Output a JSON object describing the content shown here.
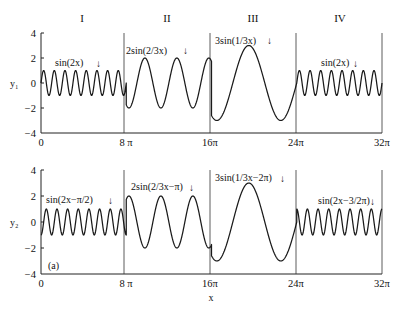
{
  "chart_data": [
    {
      "type": "line",
      "id": "top",
      "ylabel": "y₁",
      "xlabel": "",
      "xlim": [
        0,
        32
      ],
      "x_unit": "π",
      "ylim": [
        -4,
        4
      ],
      "yticks": [
        4,
        2,
        0,
        -2,
        -4
      ],
      "ytick_labels": [
        "4",
        "2",
        "0",
        "−2",
        "−4"
      ],
      "xticks": [
        0,
        8,
        16,
        24,
        32
      ],
      "xtick_labels": [
        "0",
        "8 π",
        "16π",
        "24π",
        "32π"
      ],
      "region_labels": [
        "I",
        "II",
        "III",
        "IV"
      ],
      "dividers": [
        8,
        16,
        24
      ],
      "segments": [
        {
          "region": "I",
          "x_range": [
            0,
            8
          ],
          "amplitude": 1,
          "freq": 2,
          "phase": 0,
          "label": "sin(2x)",
          "arrow": "↓"
        },
        {
          "region": "II",
          "x_range": [
            8,
            16
          ],
          "amplitude": 2,
          "freq": 0.6667,
          "phase": 0,
          "label": "2sin(2/3x)",
          "arrow": "↓"
        },
        {
          "region": "III",
          "x_range": [
            16,
            24
          ],
          "amplitude": 3,
          "freq": 0.3333,
          "phase": 0,
          "label": "3sin(1/3x)",
          "arrow": "↓"
        },
        {
          "region": "IV",
          "x_range": [
            24,
            32
          ],
          "amplitude": 1,
          "freq": 2,
          "phase": 0,
          "label": "sin(2x)",
          "arrow": "↓"
        }
      ]
    },
    {
      "type": "line",
      "id": "bottom",
      "ylabel": "y₂",
      "xlabel": "x",
      "panel_label": "(a)",
      "xlim": [
        0,
        32
      ],
      "x_unit": "π",
      "ylim": [
        -4,
        4
      ],
      "yticks": [
        4,
        2,
        0,
        -2,
        -4
      ],
      "ytick_labels": [
        "4",
        "2",
        "0",
        "−2",
        "−4"
      ],
      "xticks": [
        0,
        8,
        16,
        24,
        32
      ],
      "xtick_labels": [
        "0",
        "8 π",
        "16π",
        "24π",
        "32π"
      ],
      "dividers": [
        8,
        16,
        24
      ],
      "segments": [
        {
          "region": "I",
          "x_range": [
            0,
            8
          ],
          "amplitude": 1,
          "freq": 2,
          "phase": -1.5708,
          "label": "sin(2x−π/2)",
          "arrow": "↓"
        },
        {
          "region": "II",
          "x_range": [
            8,
            16
          ],
          "amplitude": 2,
          "freq": 0.6667,
          "phase": -3.1416,
          "label": "2sin(2/3x−π)",
          "arrow": "↓"
        },
        {
          "region": "III",
          "x_range": [
            16,
            24
          ],
          "amplitude": 3,
          "freq": 0.3333,
          "phase": -6.2832,
          "label": "3sin(1/3x−2π)",
          "arrow": "↓"
        },
        {
          "region": "IV",
          "x_range": [
            24,
            32
          ],
          "amplitude": 1,
          "freq": 2,
          "phase": -4.7124,
          "label": "sin(2x−3/2π)",
          "arrow": "↓"
        }
      ]
    }
  ]
}
